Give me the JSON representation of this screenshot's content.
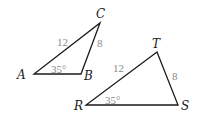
{
  "triangles": [
    {
      "name": "ABC",
      "vertices": {
        "A": "A",
        "B": "B",
        "C": "C"
      },
      "side_AC": "12",
      "side_BC": "8",
      "angle_A": "35°"
    },
    {
      "name": "RST",
      "vertices": {
        "R": "R",
        "S": "S",
        "T": "T"
      },
      "side_RT": "12",
      "side_ST": "8",
      "angle_R": "35°"
    }
  ],
  "colors": {
    "lines": "#1a1a1a",
    "measures": "#8a8a8a"
  }
}
